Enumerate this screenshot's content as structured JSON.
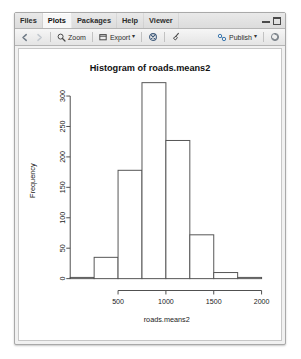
{
  "window": {
    "tabs": [
      {
        "label": "Files",
        "active": false
      },
      {
        "label": "Plots",
        "active": true
      },
      {
        "label": "Packages",
        "active": false
      },
      {
        "label": "Help",
        "active": false
      },
      {
        "label": "Viewer",
        "active": false
      }
    ],
    "controls": [
      {
        "name": "minimize-button",
        "label": ""
      },
      {
        "name": "maximize-button",
        "label": ""
      }
    ]
  },
  "toolbar": {
    "back_icon": "left-arrow-icon",
    "forward_icon": "right-arrow-icon",
    "zoom_label": "Zoom",
    "zoom_icon": "magnifier-icon",
    "export_label": "Export",
    "export_icon": "export-icon",
    "export_caret": "▾",
    "remove_icon": "remove-plot-icon",
    "clear_icon": "broom-icon",
    "publish_label": "Publish",
    "publish_icon": "publish-icon",
    "publish_caret": "▾",
    "refresh_icon": "refresh-icon"
  },
  "chart_data": {
    "type": "bar",
    "title": "Histogram of roads.means2",
    "xlabel": "roads.means2",
    "ylabel": "Frequency",
    "bin_width": 250,
    "bin_starts": [
      0,
      250,
      500,
      750,
      1000,
      1250,
      1500,
      1750
    ],
    "bin_ends": [
      250,
      500,
      750,
      1000,
      1250,
      1500,
      1750,
      2000
    ],
    "categories": [
      "0-250",
      "250-500",
      "500-750",
      "750-1000",
      "1000-1250",
      "1250-1500",
      "1500-1750",
      "1750-2000"
    ],
    "values": [
      2,
      35,
      178,
      322,
      227,
      72,
      10,
      2
    ],
    "xticks": [
      500,
      1000,
      1500,
      2000
    ],
    "yticks": [
      0,
      50,
      100,
      150,
      200,
      250,
      300
    ],
    "xlim": [
      0,
      2100
    ],
    "ylim": [
      0,
      322
    ],
    "grid": false,
    "legend": false,
    "bar_fill": "#ffffff",
    "bar_stroke": "#555555"
  }
}
